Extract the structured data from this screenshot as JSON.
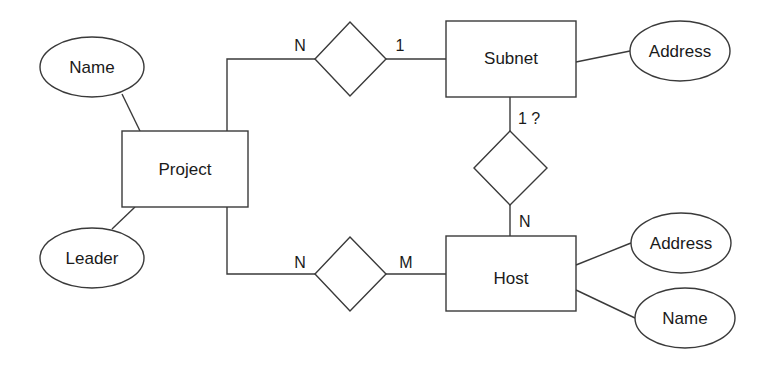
{
  "diagram": {
    "type": "entity-relationship",
    "entities": [
      {
        "id": "project",
        "label": "Project"
      },
      {
        "id": "subnet",
        "label": "Subnet"
      },
      {
        "id": "host",
        "label": "Host"
      }
    ],
    "attributes": [
      {
        "id": "project-name",
        "entity": "project",
        "label": "Name"
      },
      {
        "id": "project-leader",
        "entity": "project",
        "label": "Leader"
      },
      {
        "id": "subnet-address",
        "entity": "subnet",
        "label": "Address"
      },
      {
        "id": "host-address",
        "entity": "host",
        "label": "Address"
      },
      {
        "id": "host-name",
        "entity": "host",
        "label": "Name"
      }
    ],
    "relationships": [
      {
        "id": "project-subnet",
        "from": "project",
        "to": "subnet",
        "from_card": "N",
        "to_card": "1"
      },
      {
        "id": "subnet-host",
        "from": "subnet",
        "to": "host",
        "from_card": "1 ?",
        "to_card": "N"
      },
      {
        "id": "project-host",
        "from": "project",
        "to": "host",
        "from_card": "N",
        "to_card": "M"
      }
    ]
  },
  "colors": {
    "stroke": "#3a3a3a",
    "text": "#1a1a1a",
    "background": "#ffffff"
  }
}
